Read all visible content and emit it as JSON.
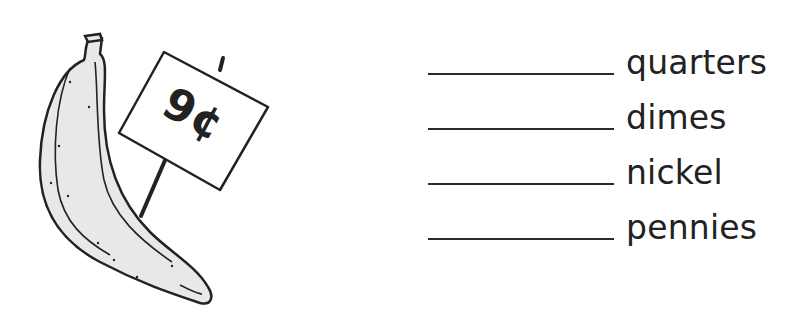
{
  "illustration": {
    "subject": "banana",
    "price_sign": "9¢"
  },
  "answers": [
    {
      "label": "quarters",
      "value": ""
    },
    {
      "label": "dimes",
      "value": ""
    },
    {
      "label": "nickel",
      "value": ""
    },
    {
      "label": "pennies",
      "value": ""
    }
  ],
  "colors": {
    "ink": "#222222",
    "banana_fill": "#e8e8e8",
    "background": "#ffffff"
  }
}
